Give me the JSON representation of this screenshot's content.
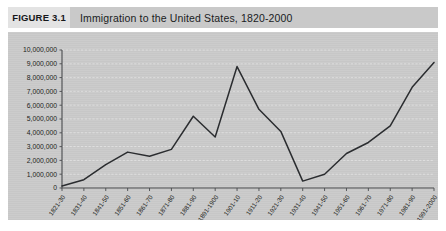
{
  "figure": {
    "tag": "FIGURE 3.1",
    "title": "Immigration to the United States, 1820-2000"
  },
  "colors": {
    "plot_background": "#cccccc",
    "title_strip": "#c9c9c9",
    "tag_background": "#e3e3e3",
    "line": "#2b2d30",
    "gridline": "#e6e6e6",
    "axis": "#4a4c4f"
  },
  "chart_data": {
    "type": "line",
    "title": "Immigration to the United States, 1820-2000",
    "xlabel": "",
    "ylabel": "",
    "ylim": [
      0,
      10000000
    ],
    "ytick_step": 1000000,
    "grid": true,
    "legend": "none",
    "ytick_labels": [
      "10,000,000",
      "9,000,000",
      "8,000,000",
      "7,000,000",
      "6,000,000",
      "5,000,000",
      "4,000,000",
      "3,000,000",
      "2,000,000",
      "1,000,000",
      "0"
    ],
    "categories": [
      "1821-30",
      "1831-40",
      "1841-50",
      "1851-60",
      "1861-70",
      "1871-80",
      "1881-90",
      "1891-1900",
      "1901-10",
      "1911-20",
      "1921-30",
      "1931-40",
      "1941-50",
      "1951-60",
      "1961-70",
      "1971-80",
      "1981-90",
      "1991-2000"
    ],
    "values": [
      150000,
      600000,
      1700000,
      2600000,
      2300000,
      2800000,
      5200000,
      3700000,
      8800000,
      5700000,
      4100000,
      500000,
      1000000,
      2500000,
      3300000,
      4500000,
      7300000,
      9100000
    ]
  }
}
